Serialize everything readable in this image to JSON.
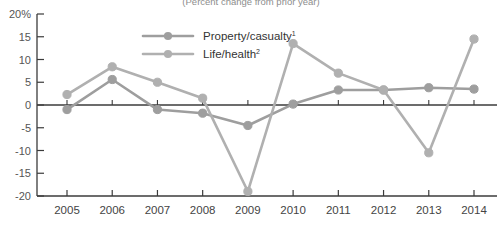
{
  "subtitle": "(Percent change from prior year)",
  "legend": {
    "position": "top-center",
    "items": [
      {
        "label": "Property/casualty",
        "footnote": "1",
        "color": "#9e9e9e"
      },
      {
        "label": "Life/health",
        "footnote": "2",
        "color": "#b0b0b0"
      }
    ]
  },
  "chart_data": {
    "type": "line",
    "title": "",
    "subtitle": "(Percent change from prior year)",
    "xlabel": "",
    "ylabel": "",
    "categories": [
      "2005",
      "2006",
      "2007",
      "2008",
      "2009",
      "2010",
      "2011",
      "2012",
      "2013",
      "2014"
    ],
    "x": [
      2005,
      2006,
      2007,
      2008,
      2009,
      2010,
      2011,
      2012,
      2013,
      2014
    ],
    "ylim": [
      -20,
      20
    ],
    "yticks": [
      20,
      15,
      10,
      5,
      0,
      -5,
      -10,
      -15,
      -20
    ],
    "ytick_labels": [
      "20%",
      "15",
      "10",
      "5",
      "0",
      "-5",
      "-10",
      "-15",
      "-20"
    ],
    "grid": false,
    "zero_line": true,
    "legend_position": "top-center",
    "series": [
      {
        "name": "Property/casualty",
        "footnote": "1",
        "color": "#9e9e9e",
        "values": [
          -1.0,
          5.6,
          -1.0,
          -1.8,
          -4.5,
          0.2,
          3.3,
          3.3,
          3.8,
          3.5
        ]
      },
      {
        "name": "Life/health",
        "footnote": "2",
        "color": "#b0b0b0",
        "values": [
          2.3,
          8.4,
          5.0,
          1.5,
          -19.0,
          13.5,
          7.0,
          3.3,
          -10.5,
          14.5
        ]
      }
    ]
  },
  "colors": {
    "axis": "#3b3b3b",
    "tick_label": "#555555",
    "subtitle": "#8d8d8d",
    "series_1": "#9e9e9e",
    "series_2": "#b0b0b0",
    "background": "#ffffff"
  }
}
